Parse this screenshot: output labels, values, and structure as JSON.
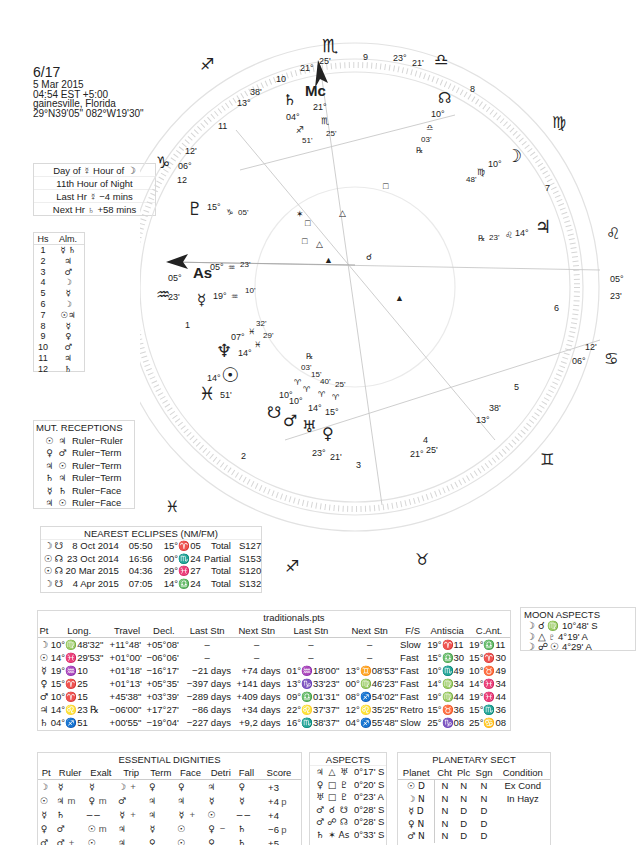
{
  "header": {
    "title": "6/17",
    "date": "5 Mar 2015",
    "time": "04:54  EST +5:00",
    "place": "gainesville, Florida",
    "coords": "29°N39'05\" 082°W19'30\""
  },
  "planetary_hours": {
    "row1": "Day of ☿  Hour of ☽",
    "row2": "11th Hour of Night",
    "row3": "Last Hr ☿  −4 mins",
    "row4": "Next Hr ♄  +58 mins"
  },
  "almuten": {
    "headers": [
      "Hs",
      "Alm."
    ],
    "rows": [
      {
        "hs": "1",
        "alm": "☿ ♄"
      },
      {
        "hs": "2",
        "alm": "♃"
      },
      {
        "hs": "3",
        "alm": "♂"
      },
      {
        "hs": "4",
        "alm": "☽"
      },
      {
        "hs": "5",
        "alm": "☿"
      },
      {
        "hs": "6",
        "alm": "☽"
      },
      {
        "hs": "7",
        "alm": "☉♃"
      },
      {
        "hs": "8",
        "alm": "☿"
      },
      {
        "hs": "9",
        "alm": "♀"
      },
      {
        "hs": "10",
        "alm": "♂"
      },
      {
        "hs": "11",
        "alm": "♃"
      },
      {
        "hs": "12",
        "alm": "♄"
      }
    ]
  },
  "mutual_receptions": {
    "title": "MUT. RECEPTIONS",
    "rows": [
      {
        "p1": "☉",
        "p2": "♃",
        "type": "Ruler−Ruler"
      },
      {
        "p1": "♀",
        "p2": "♂",
        "type": "Ruler−Term"
      },
      {
        "p1": "♃",
        "p2": "☉",
        "type": "Ruler−Term"
      },
      {
        "p1": "♄",
        "p2": "♃",
        "type": "Ruler−Term"
      },
      {
        "p1": "☿",
        "p2": "♄",
        "type": "Ruler−Face"
      },
      {
        "p1": "♃",
        "p2": "☉",
        "type": "Ruler−Face"
      }
    ]
  },
  "eclipses": {
    "title": "NEAREST ECLIPSES (NM/FM)",
    "rows": [
      {
        "lum": "☽",
        "node": "☋",
        "date": "8 Oct 2014",
        "time": "05:50",
        "pos": "15°♈05",
        "kind": "Total",
        "saros": "S127"
      },
      {
        "lum": "☉",
        "node": "☊",
        "date": "23 Oct 2014",
        "time": "16:56",
        "pos": "00°♏24",
        "kind": "Partial",
        "saros": "S153"
      },
      {
        "lum": "☉",
        "node": "☊",
        "date": "20 Mar 2015",
        "time": "04:36",
        "pos": "29°♓27",
        "kind": "Total",
        "saros": "S120"
      },
      {
        "lum": "☽",
        "node": "☋",
        "date": "4 Apr 2015",
        "time": "07:05",
        "pos": "14°♎24",
        "kind": "Total",
        "saros": "S132"
      }
    ]
  },
  "traditionals": {
    "title": "traditionals.pts",
    "headers": [
      "Pt",
      "Long.",
      "Travel",
      "Decl.",
      "Last Stn",
      "Next Stn",
      "Last Stn",
      "Next Stn",
      "F/S",
      "Antiscia",
      "C.Ant."
    ],
    "rows": [
      [
        "☽",
        "10°♍48'32\"",
        "+11°48'",
        "+05°08'",
        "–",
        "–",
        "–",
        "–",
        "Slow",
        "19°♈11",
        "19°♎11"
      ],
      [
        "☉",
        "14°♓29'53\"",
        "+01°00'",
        "−06°06'",
        "–",
        "–",
        "–",
        "–",
        "Fast",
        "15°♎30",
        "15°♈30"
      ],
      [
        "☿",
        "19°♒10",
        "+01°18'",
        "−16°17'",
        "−21 days",
        "+74 days",
        "01°♒18'00\"",
        "13°♊08'53\"",
        "Fast",
        "10°♏49",
        "10°♉49"
      ],
      [
        "♀",
        "15°♈25",
        "+01°13'",
        "+05°35'",
        "−397 days",
        "+141 days",
        "13°♑33'23\"",
        "00°♍46'23\"",
        "Fast",
        "14°♍34",
        "14°♓34"
      ],
      [
        "♂",
        "10°♈15",
        "+45'38\"",
        "+03°39'",
        "−289 days",
        "+409 days",
        "09°♎01'31\"",
        "08°♐54'02\"",
        "Fast",
        "19°♍44",
        "19°♓44"
      ],
      [
        "♃",
        "14°♌23 ℞",
        "−06'00\"",
        "+17°27'",
        "−86 days",
        "+34 days",
        "22°♌37'37\"",
        "12°♌35'25\"",
        "Retro",
        "15°♉36",
        "15°♏36"
      ],
      [
        "♄",
        "04°♐51",
        "+00'55\"",
        "−19°04'",
        "−227 days",
        "+9,2 days",
        "16°♏38'37\"",
        "04°♐55'48\"",
        "Slow",
        "25°♑08",
        "25°♋08"
      ]
    ]
  },
  "moon_aspects": {
    "title": "MOON ASPECTS",
    "rows": [
      "☽ ☌ ♍ 10°48' S",
      "☽ △ ♇  4°19' A",
      "☽ ☍ ☉  4°29' A"
    ]
  },
  "dignities": {
    "title": "ESSENTIAL DIGNITIES",
    "headers": [
      "Pt",
      "Ruler",
      "Exalt",
      "Trip",
      "Term",
      "Face",
      "Detri",
      "Fall",
      "Score"
    ],
    "rows": [
      {
        "pt": "☽",
        "ruler": "☿",
        "rm": "",
        "exalt": "☿",
        "em": "",
        "trip": "☽",
        "tm": "+",
        "term": "♀",
        "face": "♀",
        "fm": "",
        "detri": "♃",
        "dm": "",
        "fall": "♀",
        "score": "+3",
        "sm": ""
      },
      {
        "pt": "☉",
        "ruler": "♃",
        "rm": "m",
        "exalt": "♀",
        "em": "m",
        "trip": "♂",
        "tm": "",
        "term": "♃",
        "face": "♃",
        "fm": "",
        "detri": "☿",
        "dm": "",
        "fall": "☿",
        "score": "+4",
        "sm": "p"
      },
      {
        "pt": "☿",
        "ruler": "♄",
        "rm": "",
        "exalt": "−−",
        "em": "",
        "trip": "☿",
        "tm": "+",
        "term": "♃",
        "face": "☿",
        "fm": "+",
        "detri": "☉",
        "dm": "",
        "fall": "−−",
        "score": "+4",
        "sm": ""
      },
      {
        "pt": "♀",
        "ruler": "♂",
        "rm": "",
        "exalt": "☉",
        "em": "m",
        "trip": "♃",
        "tm": "",
        "term": "☿",
        "face": "☉",
        "fm": "",
        "detri": "♀",
        "dm": "−",
        "fall": "♄",
        "score": "−6",
        "sm": "p"
      },
      {
        "pt": "♂",
        "ruler": "♂",
        "rm": "+",
        "exalt": "☉",
        "em": "",
        "trip": "♃",
        "tm": "",
        "term": "♀",
        "face": "☉",
        "fm": "",
        "detri": "♀",
        "dm": "",
        "fall": "♄",
        "score": "+5",
        "sm": ""
      }
    ]
  },
  "aspects": {
    "title": "ASPECTS",
    "rows": [
      {
        "p1": "♃",
        "asp": "△",
        "p2": "♅",
        "orb": "0°17' S"
      },
      {
        "p1": "♀",
        "asp": "□",
        "p2": "♇",
        "orb": "0°20' S"
      },
      {
        "p1": "♅",
        "asp": "□",
        "p2": "♇",
        "orb": "0°23' A"
      },
      {
        "p1": "♂",
        "asp": "☌",
        "p2": "☋",
        "orb": "0°28' S"
      },
      {
        "p1": "♂",
        "asp": "☍",
        "p2": "☊",
        "orb": "0°28' S"
      },
      {
        "p1": "♄",
        "asp": "✶",
        "p2": "As",
        "orb": "0°33' S"
      }
    ]
  },
  "sect": {
    "title": "PLANETARY SECT",
    "headers": [
      "Planet",
      "Cht",
      "Plc",
      "Sgn",
      "Condition"
    ],
    "rows": [
      {
        "planet": "☉ D",
        "cht": "N",
        "plc": "N",
        "sgn": "N",
        "cond": "Ex Cond"
      },
      {
        "planet": "☽ N",
        "cht": "N",
        "plc": "N",
        "sgn": "N",
        "cond": "In Hayz"
      },
      {
        "planet": "☿ D",
        "cht": "N",
        "plc": "D",
        "sgn": "D",
        "cond": ""
      },
      {
        "planet": "♀ N",
        "cht": "N",
        "plc": "D",
        "sgn": "D",
        "cond": ""
      },
      {
        "planet": "♂ N",
        "cht": "N",
        "plc": "D",
        "sgn": "D",
        "cond": ""
      }
    ]
  },
  "wheel": {
    "signs": [
      {
        "g": "♏",
        "x": 213,
        "y": 16
      },
      {
        "g": "♎",
        "x": 347,
        "y": 40
      },
      {
        "g": "♍",
        "x": 428,
        "y": 118
      },
      {
        "g": "♌",
        "x": 478,
        "y": 222
      },
      {
        "g": "♋",
        "x": 475,
        "y": 334
      },
      {
        "g": "♊",
        "x": 416,
        "y": 425
      },
      {
        "g": "♉",
        "x": 232,
        "y": 530
      },
      {
        "g": "♈",
        "x": 233,
        "y": 534
      },
      {
        "g": "♐",
        "x": 81,
        "y": 98
      },
      {
        "g": "♒",
        "x": 25,
        "y": 295
      },
      {
        "g": "♓",
        "x": 60,
        "y": 412
      },
      {
        "g": "♑",
        "x": 30,
        "y": 175
      }
    ],
    "house_numbers": [
      {
        "n": "9",
        "x": 283,
        "y": 60
      },
      {
        "n": "8",
        "x": 418,
        "y": 92
      },
      {
        "n": "7",
        "x": 470,
        "y": 191
      },
      {
        "n": "6",
        "x": 473,
        "y": 310
      },
      {
        "n": "5",
        "x": 426,
        "y": 390
      },
      {
        "n": "4",
        "x": 326,
        "y": 437
      },
      {
        "n": "3",
        "x": 225,
        "y": 460
      },
      {
        "n": "2",
        "x": 100,
        "y": 428
      },
      {
        "n": "1",
        "x": 48,
        "y": 328
      },
      {
        "n": "12",
        "x": 45,
        "y": 182
      },
      {
        "n": "11",
        "x": 80,
        "y": 128
      },
      {
        "n": "10",
        "x": 111,
        "y": 82
      }
    ],
    "cusps": [
      {
        "deg": "21°",
        "min": "25'",
        "x": 180,
        "y": 70
      },
      {
        "deg": "23°",
        "min": "21'",
        "x": 285,
        "y": 60
      },
      {
        "deg": "05°",
        "min": "23'",
        "x": 470,
        "y": 280
      },
      {
        "deg": "06°",
        "min": "12'",
        "x": 450,
        "y": 370
      },
      {
        "deg": "13°",
        "min": "38'",
        "x": 370,
        "y": 422
      },
      {
        "deg": "21°",
        "min": "25'",
        "x": 290,
        "y": 455
      },
      {
        "deg": "23°",
        "min": "21'",
        "x": 180,
        "y": 460
      },
      {
        "deg": "05°",
        "min": "23'",
        "x": 30,
        "y": 268
      },
      {
        "deg": "06°",
        "min": "12'",
        "x": 50,
        "y": 168
      },
      {
        "deg": "13°",
        "min": "38'",
        "x": 75,
        "y": 104
      }
    ],
    "planets": [
      {
        "g": "♄",
        "label": "04° ♐ 51'",
        "x": 107,
        "y": 100
      },
      {
        "g": "Mc",
        "label": "21° ♏ 25'",
        "x": 160,
        "y": 92
      },
      {
        "g": "☊",
        "label": "10° ♎ 03' ℞",
        "x": 340,
        "y": 97
      },
      {
        "g": "☽",
        "label": "10° ♍ 48'",
        "x": 415,
        "y": 156
      },
      {
        "g": "♃",
        "label": "14° ♌ 23' ℞",
        "x": 543,
        "y": 229
      },
      {
        "g": "♇",
        "label": "15° ♑ 05'",
        "x": 195,
        "y": 189
      },
      {
        "g": "As",
        "label": "05° ♒ 23'",
        "x": 190,
        "y": 274
      },
      {
        "g": "☿",
        "label": "19° ♒ 10'",
        "x": 201,
        "y": 300
      },
      {
        "g": "♆",
        "label": "07° ♓ 32'",
        "x": 218,
        "y": 350
      },
      {
        "g": "☉",
        "label": "14° ♓ 29'",
        "x": 230,
        "y": 367
      },
      {
        "g": "☋",
        "label": "10° ♈ 03'",
        "x": 272,
        "y": 413
      },
      {
        "g": "♂",
        "label": "10° ♈ 15'",
        "x": 290,
        "y": 421
      },
      {
        "g": "♅",
        "label": "14° ♈ 40'",
        "x": 308,
        "y": 425
      },
      {
        "g": "♀",
        "label": "15° ♈ 25'",
        "x": 327,
        "y": 432
      }
    ]
  }
}
